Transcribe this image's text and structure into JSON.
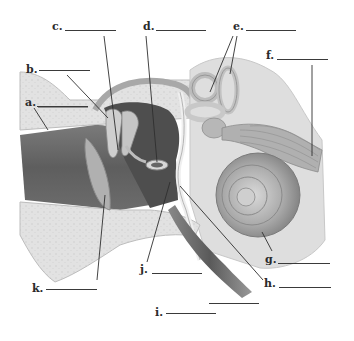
{
  "diagram": {
    "colors": {
      "background": "#ffffff",
      "skin_tissue": "#d6d6d6",
      "bone": "#e4e4e4",
      "canal_dark": "#6e6e6e",
      "middle_ear_dark": "#555555",
      "inner_ear": "#b8b8b8",
      "line": "#2f2f2f"
    },
    "labels": [
      {
        "id": "a",
        "text": "a.",
        "blank": ""
      },
      {
        "id": "b",
        "text": "b.",
        "blank": ""
      },
      {
        "id": "c",
        "text": "c.",
        "blank": ""
      },
      {
        "id": "d",
        "text": "d.",
        "blank": ""
      },
      {
        "id": "e",
        "text": "e.",
        "blank": ""
      },
      {
        "id": "f",
        "text": "f.",
        "blank": ""
      },
      {
        "id": "g",
        "text": "g.",
        "blank": ""
      },
      {
        "id": "h",
        "text": "h.",
        "blank": ""
      },
      {
        "id": "i",
        "text": "i.",
        "blank": ""
      },
      {
        "id": "j",
        "text": "j.",
        "blank": ""
      },
      {
        "id": "k",
        "text": "k.",
        "blank": ""
      }
    ]
  }
}
